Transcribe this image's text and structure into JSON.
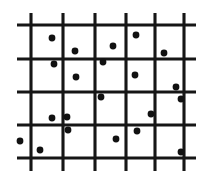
{
  "figure": {
    "type": "scatter-over-grid",
    "background_color": "#ffffff",
    "ink_color": "#161616",
    "point_color": "#111111",
    "width": 209,
    "height": 181
  },
  "chart_data": {
    "type": "scatter",
    "title": "",
    "xlabel": "",
    "ylabel": "",
    "xlim": [
      0,
      209
    ],
    "ylim": [
      0,
      181
    ],
    "grid": true,
    "legend": null,
    "grid_lines": {
      "vertical_x": [
        31,
        63,
        95,
        126,
        155,
        184
      ],
      "vertical_y_start": 13,
      "vertical_y_end": 171,
      "horizontal_y": [
        25,
        59,
        92,
        125,
        158
      ],
      "horizontal_x_start": 17,
      "horizontal_x_end": 196,
      "columns": 6,
      "rows": 5,
      "line_width_vertical": 3.1,
      "line_width_horizontal": 2.9
    },
    "point_radius": 3.4,
    "point_count": 21,
    "points": [
      {
        "x": 52,
        "y": 38
      },
      {
        "x": 75,
        "y": 51
      },
      {
        "x": 113,
        "y": 46
      },
      {
        "x": 136,
        "y": 35
      },
      {
        "x": 164,
        "y": 53
      },
      {
        "x": 54,
        "y": 64
      },
      {
        "x": 103,
        "y": 62
      },
      {
        "x": 76,
        "y": 77
      },
      {
        "x": 135,
        "y": 75
      },
      {
        "x": 176,
        "y": 87
      },
      {
        "x": 101,
        "y": 97
      },
      {
        "x": 181,
        "y": 99
      },
      {
        "x": 52,
        "y": 118
      },
      {
        "x": 67,
        "y": 117
      },
      {
        "x": 151,
        "y": 114
      },
      {
        "x": 68,
        "y": 130
      },
      {
        "x": 137,
        "y": 131
      },
      {
        "x": 116,
        "y": 139
      },
      {
        "x": 40,
        "y": 150
      },
      {
        "x": 181,
        "y": 152
      },
      {
        "x": 20,
        "y": 141
      }
    ]
  }
}
